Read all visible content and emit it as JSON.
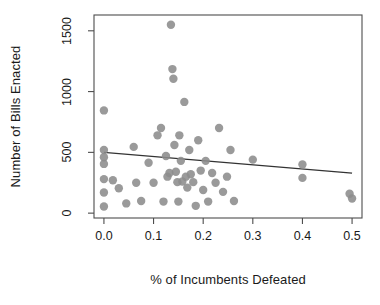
{
  "chart_data": {
    "type": "scatter",
    "title": "",
    "xlabel": "% of Incumbents Defeated",
    "ylabel": "Number of Bills Enacted",
    "xlim": [
      -0.02,
      0.52
    ],
    "ylim": [
      -40,
      1630
    ],
    "xticks": [
      0.0,
      0.1,
      0.2,
      0.3,
      0.4,
      0.5
    ],
    "xtick_labels": [
      "0.0",
      "0.1",
      "0.2",
      "0.3",
      "0.4",
      "0.5"
    ],
    "yticks": [
      0,
      500,
      1000,
      1500
    ],
    "ytick_labels": [
      "0",
      "500",
      "1000",
      "1500"
    ],
    "grid": false,
    "legend": null,
    "point_color": "#8c8c8c",
    "point_size": 4.2,
    "line_color": "#333333",
    "trendline": {
      "type": "linear-fit",
      "x_start": 0.0,
      "y_start": 500,
      "x_end": 0.5,
      "y_end": 330
    },
    "points": [
      {
        "x": 0.0,
        "y": 845
      },
      {
        "x": 0.0,
        "y": 520
      },
      {
        "x": 0.0,
        "y": 460
      },
      {
        "x": 0.0,
        "y": 405
      },
      {
        "x": 0.0,
        "y": 280
      },
      {
        "x": 0.0,
        "y": 170
      },
      {
        "x": 0.0,
        "y": 55
      },
      {
        "x": 0.018,
        "y": 270
      },
      {
        "x": 0.03,
        "y": 205
      },
      {
        "x": 0.045,
        "y": 80
      },
      {
        "x": 0.06,
        "y": 545
      },
      {
        "x": 0.065,
        "y": 250
      },
      {
        "x": 0.075,
        "y": 100
      },
      {
        "x": 0.09,
        "y": 415
      },
      {
        "x": 0.1,
        "y": 250
      },
      {
        "x": 0.108,
        "y": 640
      },
      {
        "x": 0.115,
        "y": 700
      },
      {
        "x": 0.12,
        "y": 95
      },
      {
        "x": 0.125,
        "y": 470
      },
      {
        "x": 0.128,
        "y": 300
      },
      {
        "x": 0.132,
        "y": 330
      },
      {
        "x": 0.135,
        "y": 1550
      },
      {
        "x": 0.138,
        "y": 1185
      },
      {
        "x": 0.14,
        "y": 1105
      },
      {
        "x": 0.142,
        "y": 560
      },
      {
        "x": 0.145,
        "y": 340
      },
      {
        "x": 0.148,
        "y": 255
      },
      {
        "x": 0.15,
        "y": 95
      },
      {
        "x": 0.152,
        "y": 640
      },
      {
        "x": 0.155,
        "y": 430
      },
      {
        "x": 0.158,
        "y": 260
      },
      {
        "x": 0.162,
        "y": 915
      },
      {
        "x": 0.165,
        "y": 300
      },
      {
        "x": 0.168,
        "y": 210
      },
      {
        "x": 0.172,
        "y": 520
      },
      {
        "x": 0.175,
        "y": 320
      },
      {
        "x": 0.18,
        "y": 255
      },
      {
        "x": 0.185,
        "y": 60
      },
      {
        "x": 0.19,
        "y": 600
      },
      {
        "x": 0.195,
        "y": 350
      },
      {
        "x": 0.2,
        "y": 190
      },
      {
        "x": 0.205,
        "y": 430
      },
      {
        "x": 0.21,
        "y": 95
      },
      {
        "x": 0.218,
        "y": 330
      },
      {
        "x": 0.225,
        "y": 250
      },
      {
        "x": 0.232,
        "y": 700
      },
      {
        "x": 0.24,
        "y": 175
      },
      {
        "x": 0.248,
        "y": 300
      },
      {
        "x": 0.255,
        "y": 520
      },
      {
        "x": 0.262,
        "y": 100
      },
      {
        "x": 0.3,
        "y": 440
      },
      {
        "x": 0.4,
        "y": 400
      },
      {
        "x": 0.4,
        "y": 290
      },
      {
        "x": 0.495,
        "y": 160
      },
      {
        "x": 0.5,
        "y": 120
      }
    ]
  },
  "axis": {
    "plot_box": {
      "left": 94,
      "top": 15,
      "right": 362,
      "bottom": 218
    }
  }
}
